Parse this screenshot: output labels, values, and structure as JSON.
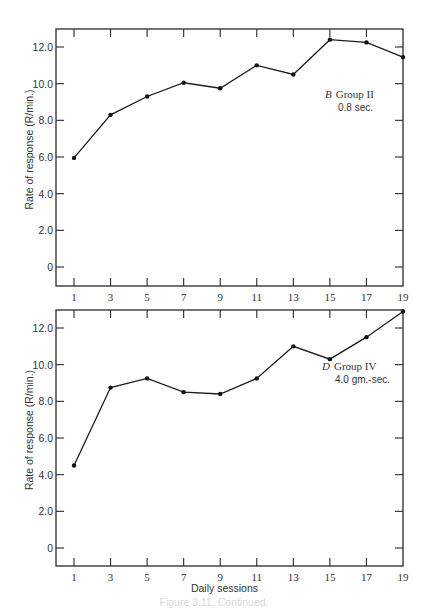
{
  "chart_data": [
    {
      "type": "line",
      "panel": "top",
      "title": "",
      "xlabel": "",
      "ylabel": "Rate of response (R/min.)",
      "x": [
        1,
        3,
        5,
        7,
        9,
        11,
        13,
        15,
        17,
        19
      ],
      "x_tick_labels": [
        "1",
        "3",
        "5",
        "7",
        "9",
        "11",
        "13",
        "15",
        "17",
        "19"
      ],
      "y_ticks": [
        0,
        2,
        4,
        6,
        8,
        10,
        12
      ],
      "y_tick_labels": [
        "0",
        "2.0",
        "4.0",
        "6.0",
        "8.0",
        "10.0",
        "12.0"
      ],
      "xlim": [
        0,
        19
      ],
      "ylim": [
        -1.0,
        13.0
      ],
      "grid": false,
      "annotation": {
        "letter": "B",
        "group": "Group II",
        "detail": "0.8 sec."
      },
      "annotation_position": "top-right",
      "series": [
        {
          "name": "Group II (0.8 sec.)",
          "values": [
            5.95,
            8.3,
            9.3,
            10.05,
            9.75,
            11.0,
            10.5,
            12.4,
            12.25,
            11.45
          ]
        }
      ]
    },
    {
      "type": "line",
      "panel": "bottom",
      "title": "",
      "xlabel": "Daily sessions",
      "ylabel": "Rate of response (R/min.)",
      "x": [
        1,
        3,
        5,
        7,
        9,
        11,
        13,
        15,
        17,
        19
      ],
      "x_tick_labels": [
        "1",
        "3",
        "5",
        "7",
        "9",
        "11",
        "13",
        "15",
        "17",
        "19"
      ],
      "y_ticks": [
        0,
        2,
        4,
        6,
        8,
        10,
        12
      ],
      "y_tick_labels": [
        "0",
        "2.0",
        "4.0",
        "6.0",
        "8.0",
        "10.0",
        "12.0"
      ],
      "xlim": [
        0,
        19
      ],
      "ylim": [
        -1.0,
        13.0
      ],
      "grid": false,
      "annotation": {
        "letter": "D",
        "group": "Group IV",
        "detail": "4.0 gm.-sec."
      },
      "annotation_position": "top-right",
      "series": [
        {
          "name": "Group IV (4.0 gm.-sec.)",
          "values": [
            4.5,
            8.75,
            9.25,
            8.5,
            8.4,
            9.25,
            11.0,
            10.3,
            11.5,
            12.9
          ]
        }
      ]
    }
  ],
  "caption": "Figure 3.11. Continued."
}
